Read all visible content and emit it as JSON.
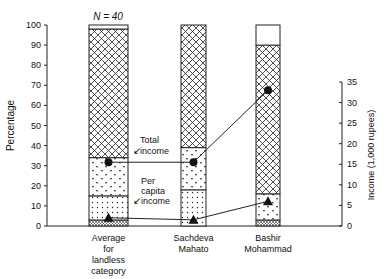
{
  "chart_data": {
    "type": "bar",
    "subtype": "stacked-bar-with-line-overlay",
    "title": "",
    "annotation_n": "N = 40",
    "ylabel": "Percentage",
    "ylabel_right": "Income (1,000 rupees)",
    "ylim": [
      0,
      100
    ],
    "ylim_right": [
      0,
      35
    ],
    "yticks": [
      0,
      10,
      20,
      30,
      40,
      50,
      60,
      70,
      80,
      90,
      100
    ],
    "yticks_right": [
      0,
      5,
      10,
      15,
      20,
      25,
      30,
      35
    ],
    "categories": [
      "Average for landless category",
      "Sachdeva Mahato",
      "Bashir Mohammad"
    ],
    "category_lines": [
      [
        "Average",
        "for",
        "landless",
        "category"
      ],
      [
        "Sachdeva",
        "Mahato"
      ],
      [
        "Bashir",
        "Mohammad"
      ]
    ],
    "stack_segments": [
      {
        "name": "bottom fine-hatch",
        "pattern": "fine",
        "values": [
          3,
          0,
          3
        ]
      },
      {
        "name": "dots",
        "pattern": "dots",
        "values": [
          12,
          18,
          0
        ]
      },
      {
        "name": "triangles",
        "pattern": "triangles",
        "values": [
          19,
          21,
          13
        ]
      },
      {
        "name": "cross-hatch",
        "pattern": "crosshatch",
        "values": [
          64,
          61,
          74
        ]
      },
      {
        "name": "blank",
        "pattern": "blank",
        "values": [
          2,
          0,
          10
        ]
      }
    ],
    "series": [
      {
        "name": "Total income",
        "marker": "circle",
        "axis": "right",
        "values": [
          15.5,
          15.5,
          33
        ]
      },
      {
        "name": "Per capita income",
        "marker": "triangle",
        "axis": "right",
        "values": [
          2,
          1.5,
          6
        ]
      }
    ],
    "labels": {
      "total_income": [
        "Total",
        "income"
      ],
      "per_capita_income": [
        "Per",
        "capita",
        "income"
      ]
    },
    "grid": false,
    "legend": "inline annotations"
  }
}
